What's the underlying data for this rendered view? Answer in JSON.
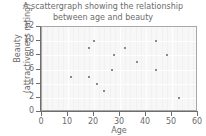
{
  "chart_data": {
    "type": "scatter",
    "title": "A scattergraph showing the relationship between age and beauty",
    "title_line1": "A scattergraph showing the relationship",
    "title_line2": "between age and beauty",
    "xlabel": "Age",
    "ylabel": "Beauty (attractiveness rating)",
    "ylabel_line1": "Beauty",
    "ylabel_line2": "(attractiveness rating)",
    "xlim": [
      0,
      60
    ],
    "ylim": [
      0,
      12
    ],
    "xticks": [
      0,
      10,
      20,
      30,
      40,
      50,
      60
    ],
    "yticks": [
      0,
      2,
      4,
      6,
      8,
      10,
      12
    ],
    "xtick_labels": [
      "0",
      "10",
      "20",
      "30",
      "40",
      "50",
      "60"
    ],
    "ytick_labels": [
      "0",
      "2",
      "4",
      "6",
      "8",
      "10",
      "12"
    ],
    "grid": true,
    "grid_color": "#ffffff",
    "plot_background": "#f7f7f7",
    "marker_color": "#8a8a8a",
    "marker_size": 2,
    "legend": null,
    "x": [
      11,
      18,
      18,
      20,
      21,
      24,
      27,
      27.5,
      32,
      36.5,
      44,
      44,
      48,
      52.5
    ],
    "y": [
      5,
      9,
      5,
      10,
      4,
      3,
      6,
      8,
      9,
      7,
      10,
      6,
      8,
      2
    ],
    "points": [
      {
        "age": 11,
        "beauty": 5
      },
      {
        "age": 18,
        "beauty": 9
      },
      {
        "age": 18,
        "beauty": 5
      },
      {
        "age": 20,
        "beauty": 10
      },
      {
        "age": 21,
        "beauty": 4
      },
      {
        "age": 24,
        "beauty": 3
      },
      {
        "age": 27,
        "beauty": 6
      },
      {
        "age": 27.5,
        "beauty": 8
      },
      {
        "age": 32,
        "beauty": 9
      },
      {
        "age": 36.5,
        "beauty": 7
      },
      {
        "age": 44,
        "beauty": 10
      },
      {
        "age": 44,
        "beauty": 6
      },
      {
        "age": 48,
        "beauty": 8
      },
      {
        "age": 52.5,
        "beauty": 2
      }
    ]
  }
}
